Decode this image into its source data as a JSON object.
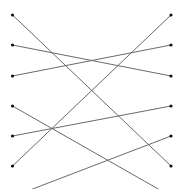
{
  "diagram": {
    "type": "bipartite-matching",
    "width": 196,
    "height": 189,
    "line_color": "#6a6a6a",
    "node_color": "#111111",
    "left_nodes": [
      {
        "id": "L0",
        "x": 12.5,
        "y": 15
      },
      {
        "id": "L1",
        "x": 12.5,
        "y": 45
      },
      {
        "id": "L2",
        "x": 12.5,
        "y": 76
      },
      {
        "id": "L3",
        "x": 12.5,
        "y": 106
      },
      {
        "id": "L4",
        "x": 12.5,
        "y": 136
      },
      {
        "id": "L5",
        "x": 12.5,
        "y": 166
      }
    ],
    "right_nodes": [
      {
        "id": "R0",
        "x": 171,
        "y": 15
      },
      {
        "id": "R1",
        "x": 171,
        "y": 45
      },
      {
        "id": "R2",
        "x": 171,
        "y": 76
      },
      {
        "id": "R3",
        "x": 171,
        "y": 106
      },
      {
        "id": "R4",
        "x": 171,
        "y": 136
      },
      {
        "id": "R5",
        "x": 171,
        "y": 166
      }
    ],
    "edges": [
      {
        "from": "L0",
        "to": "R5",
        "x1": 12.5,
        "y1": 15,
        "x2": 171,
        "y2": 166
      },
      {
        "from": "L1",
        "to": "R2",
        "x1": 12.5,
        "y1": 45,
        "x2": 171,
        "y2": 76
      },
      {
        "from": "L2",
        "to": "R1",
        "x1": 12.5,
        "y1": 76,
        "x2": 171,
        "y2": 45
      },
      {
        "from": "L3",
        "to": "offscreen-bottom",
        "x1": 12.5,
        "y1": 106,
        "x2": 160,
        "y2": 190
      },
      {
        "from": "L4",
        "to": "R3",
        "x1": 12.5,
        "y1": 136,
        "x2": 171,
        "y2": 106
      },
      {
        "from": "L5",
        "to": "R0",
        "x1": 12.5,
        "y1": 166,
        "x2": 171,
        "y2": 15
      },
      {
        "from": "offscreen-bottom",
        "to": "R4",
        "x1": 30,
        "y1": 190,
        "x2": 171,
        "y2": 136
      }
    ]
  }
}
